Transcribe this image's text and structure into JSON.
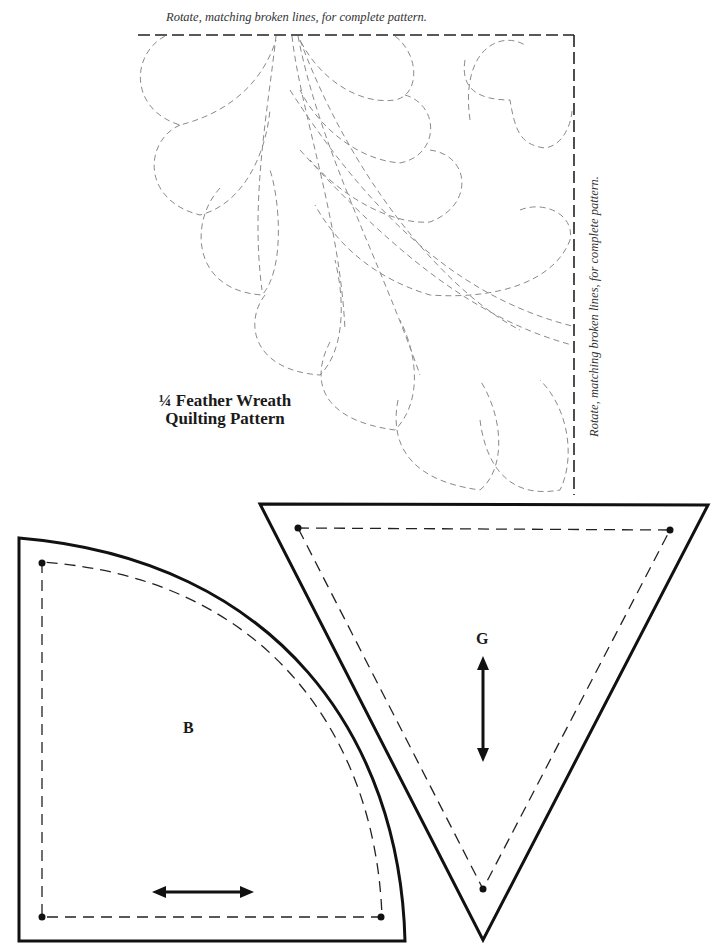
{
  "quilting_pattern": {
    "title_line1": "¼ Feather Wreath",
    "title_line2": "Quilting Pattern",
    "instruction_top": "Rotate, matching broken lines, for complete pattern.",
    "instruction_side": "Rotate, matching broken lines, for complete pattern."
  },
  "templates": [
    {
      "id": "B",
      "label": "B",
      "shape": "quarter-circle",
      "grain_arrow": "horizontal"
    },
    {
      "id": "G",
      "label": "G",
      "shape": "inverted-triangle",
      "grain_arrow": "vertical"
    }
  ],
  "colors": {
    "cut_line": "#111111",
    "sewing_line": "#222222",
    "quilting_line": "#8a8a8a",
    "background": "#ffffff"
  }
}
